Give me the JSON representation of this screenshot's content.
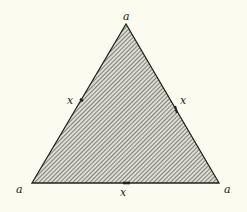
{
  "diagram": {
    "type": "equilateral-triangle",
    "fill": "diagonal-hatch",
    "colors": {
      "background": "#fbfbef",
      "stroke": "#222222",
      "hatch": "#555555",
      "hatch_bg": "#d8d8cc"
    },
    "vertices": [
      {
        "id": "top",
        "x": 126,
        "y": 24,
        "label": "a"
      },
      {
        "id": "bottom-left",
        "x": 32,
        "y": 183,
        "label": "a"
      },
      {
        "id": "bottom-right",
        "x": 219,
        "y": 183,
        "label": "a"
      }
    ],
    "sides": [
      {
        "id": "left",
        "label": "x"
      },
      {
        "id": "right",
        "label": "x"
      },
      {
        "id": "bottom",
        "label": "x"
      }
    ],
    "labels": {
      "vertex_top": "a",
      "vertex_bottom_left": "a",
      "vertex_bottom_right": "a",
      "side_left": "x",
      "side_right": "x",
      "side_bottom": "x"
    }
  }
}
